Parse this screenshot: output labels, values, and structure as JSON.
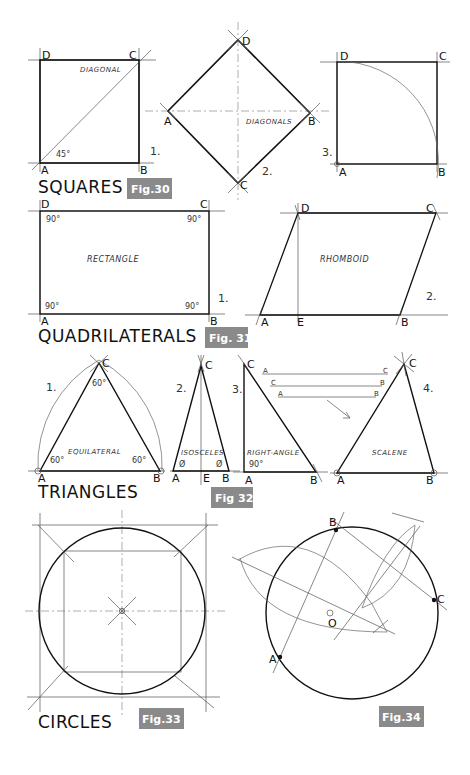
{
  "squares": {
    "title": "SQUARES",
    "badge": "Fig.30",
    "fig1": {
      "number": "1.",
      "labels": {
        "A": "A",
        "B": "B",
        "C": "C",
        "D": "D"
      },
      "diagonal": "DIAGONAL",
      "angle": "45°"
    },
    "fig2": {
      "number": "2.",
      "labels": {
        "A": "A",
        "B": "B",
        "C": "C",
        "D": "D"
      },
      "diagonals": "DIAGONALS"
    },
    "fig3": {
      "number": "3.",
      "labels": {
        "A": "A",
        "B": "B",
        "C": "C",
        "D": "D"
      }
    }
  },
  "quadrilaterals": {
    "title": "QUADRILATERALS",
    "badge": "Fig. 31",
    "fig1": {
      "number": "1.",
      "name": "RECTANGLE",
      "angle": "90°",
      "labels": {
        "A": "A",
        "B": "B",
        "C": "C",
        "D": "D"
      }
    },
    "fig2": {
      "number": "2.",
      "name": "RHOMBOID",
      "labels": {
        "A": "A",
        "B": "B",
        "C": "C",
        "D": "D",
        "E": "E"
      }
    }
  },
  "triangles": {
    "title": "TRIANGLES",
    "badge": "Fig 32",
    "fig1": {
      "number": "1.",
      "name": "EQUILATERAL",
      "angle": "60°",
      "labels": {
        "A": "A",
        "B": "B",
        "C": "C"
      }
    },
    "fig2": {
      "number": "2.",
      "name": "ISOSCELES",
      "angle": "Ø",
      "labels": {
        "A": "A",
        "B": "B",
        "C": "C",
        "E": "E"
      }
    },
    "fig3": {
      "number": "3.",
      "name": "RIGHT-ANGLE",
      "angle": "90°",
      "labels": {
        "A": "A",
        "B": "B",
        "C": "C"
      }
    },
    "fig4": {
      "number": "4.",
      "name": "SCALENE",
      "labels": {
        "A": "A",
        "B": "B",
        "C": "C"
      },
      "side_lines": [
        {
          "left": "A",
          "right": "C"
        },
        {
          "left": "C",
          "right": "B"
        },
        {
          "left": "A",
          "right": "B"
        }
      ]
    }
  },
  "circles": {
    "title": "CIRCLES",
    "badge_33": "Fig.33",
    "badge_34": "Fig.34",
    "fig34_labels": {
      "A": "A",
      "B": "B",
      "C": "C",
      "O": "O"
    }
  }
}
